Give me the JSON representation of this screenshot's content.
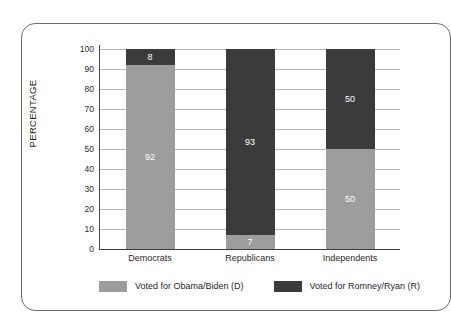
{
  "chart_data": {
    "type": "bar",
    "subtype": "stacked-percentage",
    "title": "",
    "xlabel": "",
    "ylabel": "PERCENTAGE",
    "ylim": [
      0,
      100
    ],
    "ytick_step": 10,
    "ytick_labels": [
      "100",
      "90",
      "80",
      "70",
      "60",
      "50",
      "40",
      "30",
      "20",
      "10",
      "0"
    ],
    "grid": true,
    "legend_position": "bottom",
    "categories": [
      "Democrats",
      "Republicans",
      "Independents"
    ],
    "series": [
      {
        "name": "Voted for Obama/Biden (D)",
        "color": "#9d9d9d",
        "values": [
          92,
          7,
          50
        ]
      },
      {
        "name": "Voted for Romney/Ryan (R)",
        "color": "#3b3b3b",
        "values": [
          8,
          93,
          50
        ]
      }
    ],
    "bars": [
      {
        "category": "Democrats",
        "segments": [
          {
            "series": "Voted for Romney/Ryan (R)",
            "value": 8,
            "label": "8",
            "color": "#3b3b3b"
          },
          {
            "series": "Voted for Obama/Biden (D)",
            "value": 92,
            "label": "92",
            "color": "#9d9d9d"
          }
        ]
      },
      {
        "category": "Republicans",
        "segments": [
          {
            "series": "Voted for Romney/Ryan (R)",
            "value": 93,
            "label": "93",
            "color": "#3b3b3b"
          },
          {
            "series": "Voted for Obama/Biden (D)",
            "value": 7,
            "label": "7",
            "color": "#9d9d9d"
          }
        ]
      },
      {
        "category": "Independents",
        "segments": [
          {
            "series": "Voted for Romney/Ryan (R)",
            "value": 50,
            "label": "50",
            "color": "#3b3b3b"
          },
          {
            "series": "Voted for Obama/Biden (D)",
            "value": 50,
            "label": "50",
            "color": "#9d9d9d"
          }
        ]
      }
    ]
  },
  "axis": {
    "y_label": "PERCENTAGE",
    "y_ticks": [
      "100",
      "90",
      "80",
      "70",
      "60",
      "50",
      "40",
      "30",
      "20",
      "10",
      "0"
    ],
    "x_ticks": [
      "Democrats",
      "Republicans",
      "Independents"
    ]
  },
  "legend": {
    "items": [
      {
        "label": "Voted for Obama/Biden (D)",
        "color": "#9d9d9d"
      },
      {
        "label": "Voted for Romney/Ryan (R)",
        "color": "#3b3b3b"
      }
    ]
  },
  "colors": {
    "democrat_gray": "#9d9d9d",
    "republican_dark": "#3b3b3b",
    "gridline": "#b9b9b9",
    "axis": "#3d3d3d",
    "frame_border": "#6b6b6b",
    "text": "#1f1f1f",
    "value_text": "#ffffff"
  }
}
